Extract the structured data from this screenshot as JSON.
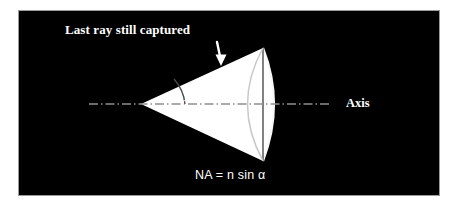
{
  "figure": {
    "domain_label": "optics-numerical-aperture-diagram",
    "panel": {
      "background_color": "#000000",
      "border_color": "#9a9a9a",
      "page_background": "#ffffff"
    }
  },
  "labels": {
    "title": "Last ray still captured",
    "angle": "α",
    "axis": "Axis",
    "formula": "NA = n sin α"
  },
  "colors": {
    "cone_fill": "#ffffff",
    "lens_arc": "#f2f2f2",
    "inner_arc": "#cfcfcf",
    "axis_line": "#8a8a8a",
    "angle_arc": "#555555",
    "arrow": "#ffffff",
    "text": "#ffffff"
  },
  "geometry": {
    "cone_apex": [
      122,
      93
    ],
    "cone_top_vertex": [
      244,
      37
    ],
    "cone_bottom_vertex": [
      244,
      150
    ],
    "lens_outer_bulge_x": 264,
    "inner_arc_bulge_x": 215,
    "axis_start_x": 70,
    "axis_end_x": 312,
    "axis_y": 93,
    "arrow_tip": [
      202,
      54
    ],
    "angle_arc_radius": 40
  },
  "icons": {
    "pointer": "down-arrow-icon",
    "angle_marker": "angle-arc-icon",
    "axis": "dash-dot-axis-line-icon"
  }
}
